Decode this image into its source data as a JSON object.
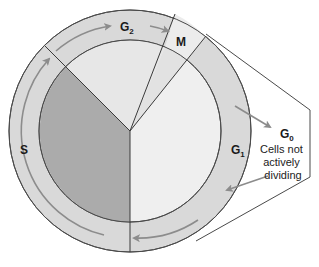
{
  "diagram": {
    "phases": [
      {
        "id": "G2",
        "label": "G",
        "sub": "2"
      },
      {
        "id": "M",
        "label": "M"
      },
      {
        "id": "G1",
        "label": "G",
        "sub": "1"
      },
      {
        "id": "S",
        "label": "S"
      }
    ],
    "g0": {
      "label": "G",
      "sub": "0",
      "description_lines": [
        "Cells not",
        "actively",
        "dividing"
      ]
    },
    "colors": {
      "ring": "#d9d9d9",
      "s_phase": "#ababab",
      "g1_inner": "#efefef",
      "g2_inner": "#e7e7e7",
      "m_inner": "#e2e2e2",
      "arrow": "#8c8c8c",
      "line": "#4a4a4a"
    }
  }
}
